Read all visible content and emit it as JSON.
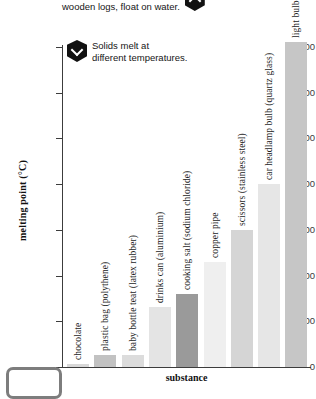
{
  "annotations": [
    {
      "id": "float-note",
      "icon": "hexagon-up-chevron-icon",
      "text": "Some solids, such as most\nwooden logs, float on water."
    },
    {
      "id": "melt-note",
      "icon": "hexagon-down-chevron-icon",
      "text": "Solids melt at\ndifferent temperatures."
    }
  ],
  "chart_data": {
    "type": "bar",
    "title": "",
    "xlabel": "substance",
    "ylabel": "melting point (°C)",
    "ylim": [
      0,
      3500
    ],
    "yticks": [
      0,
      500,
      1000,
      1500,
      2000,
      2500,
      3000,
      3500
    ],
    "ytick_labels": [
      "0",
      "500",
      "1,000",
      "1,500",
      "2,000",
      "2,500",
      "3,000",
      "3,500"
    ],
    "grid": false,
    "legend": "none",
    "categories": [
      "chocolate",
      "plastic bag (polythene)",
      "baby bottle teat (latex rubber)",
      "drinks can (aluminium)",
      "cooking salt (sodium chloride)",
      "copper pipe",
      "scissors (stainless steel)",
      "car headlamp bulb (quartz glass)",
      "light bulb filament (tungsten)"
    ],
    "values": [
      35,
      130,
      130,
      660,
      800,
      1150,
      1500,
      2000,
      3550
    ],
    "bar_colors": [
      "#d8d8d8",
      "#c2c2c2",
      "#dcdcdc",
      "#e4e4e4",
      "#9a9a9a",
      "#efefef",
      "#d5d5d5",
      "#e6e6e6",
      "#c6c6c6"
    ]
  },
  "corner": {
    "icon": "rounded-device-outline-icon"
  }
}
